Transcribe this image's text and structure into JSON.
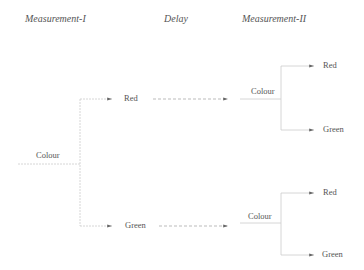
{
  "headers": {
    "measurement1": "Measurement-I",
    "delay": "Delay",
    "measurement2": "Measurement-II"
  },
  "nodes": {
    "root": "Colour",
    "branch_red": "Red",
    "branch_green": "Green",
    "upper_colour": "Colour",
    "upper_red": "Red",
    "upper_green": "Green",
    "lower_colour": "Colour",
    "lower_red": "Red",
    "lower_green": "Green"
  },
  "colors": {
    "line": "#c8c8c8",
    "text": "#555555"
  }
}
